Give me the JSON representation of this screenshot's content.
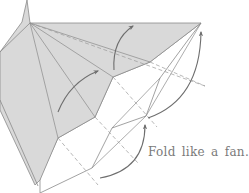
{
  "diagram": {
    "type": "origami-fold-instruction",
    "caption": "Fold like a fan.",
    "colors": {
      "paper_colored": "#d9d9d9",
      "paper_white": "#ffffff",
      "line": "#8a8a8a",
      "arrow": "#6e6e6e",
      "text": "#7a7a7a"
    },
    "elements": {
      "colored_flap": "gray folded flap (colored side)",
      "white_flap": "white pleated section",
      "valley_lines": "dashed fold lines radiating from apex",
      "arrows": [
        "fold-arrow-upper",
        "fold-arrow-middle",
        "fold-arrow-right-top",
        "fold-arrow-bottom"
      ]
    }
  }
}
